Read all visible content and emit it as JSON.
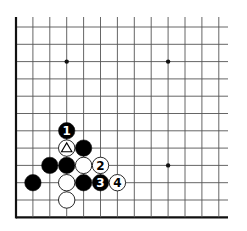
{
  "diagram": {
    "type": "go-board-fragment",
    "grid": {
      "columns": 13,
      "rows": 12,
      "origin_x": 16,
      "origin_y": 27,
      "spacing_x": 16.9,
      "spacing_y": 17.3,
      "line_top": 17,
      "line_right": 228,
      "edges": [
        "left",
        "bottom"
      ],
      "line_color": "#555555",
      "edge_color": "#111111"
    },
    "star_points": [
      {
        "col": 3,
        "row": 2
      },
      {
        "col": 9,
        "row": 2
      },
      {
        "col": 9,
        "row": 8
      }
    ],
    "stones": [
      {
        "col": 3,
        "row": 6,
        "color": "black",
        "label": "1"
      },
      {
        "col": 3,
        "row": 7,
        "color": "white",
        "marker": "triangle"
      },
      {
        "col": 4,
        "row": 7,
        "color": "black"
      },
      {
        "col": 2,
        "row": 8,
        "color": "black"
      },
      {
        "col": 3,
        "row": 8,
        "color": "black"
      },
      {
        "col": 4,
        "row": 8,
        "color": "white"
      },
      {
        "col": 5,
        "row": 8,
        "color": "white",
        "label": "2"
      },
      {
        "col": 1,
        "row": 9,
        "color": "black"
      },
      {
        "col": 3,
        "row": 9,
        "color": "white"
      },
      {
        "col": 4,
        "row": 9,
        "color": "black"
      },
      {
        "col": 5,
        "row": 9,
        "color": "black",
        "label": "3"
      },
      {
        "col": 6,
        "row": 9,
        "color": "white",
        "label": "4"
      },
      {
        "col": 3,
        "row": 10,
        "color": "white"
      }
    ],
    "colors": {
      "black_stone": "#000000",
      "white_stone": "#ffffff",
      "white_stone_outline": "#111111",
      "label_on_black": "#ffffff",
      "label_on_white": "#000000"
    }
  }
}
